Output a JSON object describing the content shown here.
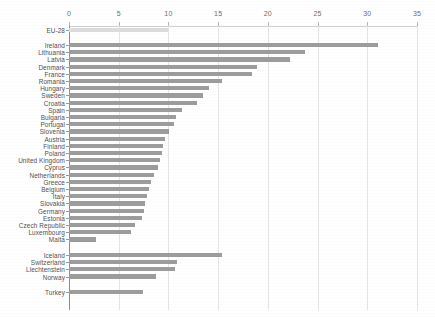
{
  "chart_data": {
    "type": "bar",
    "orientation": "horizontal",
    "title": "",
    "xlabel": "",
    "ylabel": "",
    "xlim": [
      0,
      35
    ],
    "xticks": [
      0,
      5,
      10,
      15,
      20,
      25,
      30,
      35
    ],
    "grid": true,
    "legend": "none",
    "colors": {
      "eu_aggregate_bar": "#dcdcdc",
      "country_bar": "#9c9c9c",
      "axis": "#8c8c8c",
      "gridline": "#e4e4e4",
      "label_text": "#4f4f4f"
    },
    "groups": [
      {
        "name": "eu-aggregate",
        "categories": [
          "EU-28"
        ],
        "values": [
          10.0
        ]
      },
      {
        "name": "eu-member-states",
        "categories": [
          "Ireland",
          "Lithuania",
          "Latvia",
          "Denmark",
          "France",
          "Romania",
          "Hungary",
          "Sweden",
          "Croatia",
          "Spain",
          "Bulgaria",
          "Portugal",
          "Slovenia",
          "Austria",
          "Finland",
          "Poland",
          "United Kingdom",
          "Cyprus",
          "Netherlands",
          "Greece",
          "Belgium",
          "Italy",
          "Slovakia",
          "Germany",
          "Estonia",
          "Czech Republic",
          "Luxembourg",
          "Malta"
        ],
        "values": [
          31.1,
          23.7,
          22.2,
          18.9,
          18.4,
          15.4,
          14.1,
          13.5,
          12.9,
          11.4,
          10.8,
          10.6,
          10.1,
          9.7,
          9.5,
          9.4,
          9.2,
          9.0,
          8.5,
          8.2,
          8.0,
          7.8,
          7.6,
          7.5,
          7.3,
          6.6,
          6.2,
          2.7
        ]
      },
      {
        "name": "efta-candidates",
        "categories": [
          "Iceland",
          "Switzerland",
          "Liechtenstein",
          "Norway"
        ],
        "values": [
          15.4,
          10.9,
          10.7,
          8.8
        ]
      },
      {
        "name": "candidate-country",
        "categories": [
          "Turkey"
        ],
        "values": [
          7.4
        ]
      }
    ]
  }
}
